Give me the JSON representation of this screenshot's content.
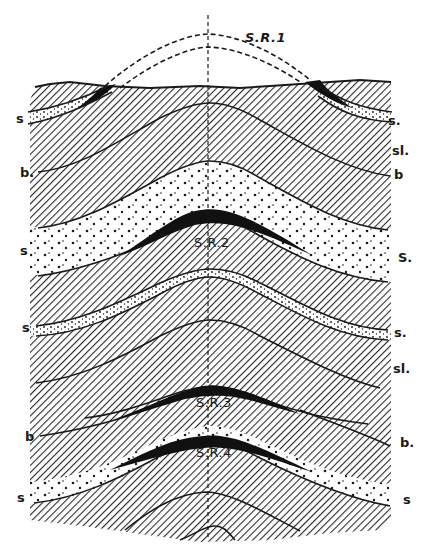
{
  "figure": {
    "type": "geological cross-section of an anticline with saddle reefs",
    "colors": {
      "ink": "#1a1a1a",
      "background": "#ffffff",
      "hatch": "#2a2a2a"
    }
  },
  "labels": {
    "saddle_reefs": [
      "S.R.1",
      "S.R.2",
      "S.R.3",
      "S.R.4"
    ],
    "left": [
      "s",
      "b.",
      "s",
      "s",
      "b",
      "s"
    ],
    "right": [
      "s.",
      "sl.",
      "b",
      "S.",
      "s.",
      "sl.",
      "b.",
      "s"
    ]
  },
  "legend_meaning": {
    "s": "sandstone",
    "sl": "slate",
    "b": "bedding",
    "S.R.": "saddle reef"
  }
}
